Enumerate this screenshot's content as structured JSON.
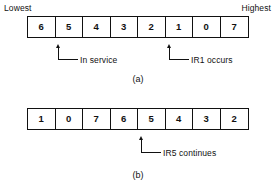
{
  "figure": {
    "scale_labels": {
      "lowest": "Lowest",
      "highest": "Highest"
    },
    "panels": [
      {
        "id": "a",
        "caption": "(a)",
        "cells": [
          "6",
          "5",
          "4",
          "3",
          "2",
          "1",
          "0",
          "7"
        ],
        "callouts": [
          {
            "label": "In service",
            "points_at_cell_index": 1,
            "points_at_value": "5"
          },
          {
            "label": "IR1 occurs",
            "points_at_cell_index": 5,
            "points_at_value": "1"
          }
        ]
      },
      {
        "id": "b",
        "caption": "(b)",
        "cells": [
          "1",
          "0",
          "7",
          "6",
          "5",
          "4",
          "3",
          "2"
        ],
        "callouts": [
          {
            "label": "IR5 continues",
            "points_at_cell_index": 4,
            "points_at_value": "5"
          }
        ]
      }
    ],
    "colors": {
      "background": "#ffffff",
      "ink": "#111111"
    }
  }
}
